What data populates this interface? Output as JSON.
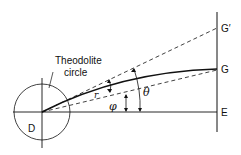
{
  "diagram": {
    "labels": {
      "theodolite": "Theodolite",
      "circle": "circle",
      "D": "D",
      "E": "E",
      "G": "G",
      "G_prime": "G′",
      "r": "r",
      "phi": "φ",
      "theta": "θ"
    },
    "colors": {
      "ink": "#111111",
      "background": "#ffffff"
    }
  }
}
